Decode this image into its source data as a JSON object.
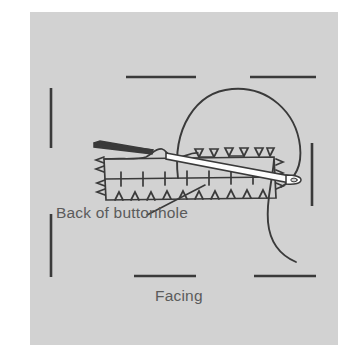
{
  "figure": {
    "type": "sewing-illustration",
    "panel": {
      "background_color": "#d2d2d2",
      "page_background_color": "#ffffff"
    },
    "ink_color": "#3a3a3a",
    "label_color": "#5b5b5b",
    "labels": [
      {
        "id": "back-of-buttonhole",
        "text": "Back of buttonhole"
      },
      {
        "id": "facing",
        "text": "Facing"
      }
    ],
    "parts": [
      {
        "name": "buttonhole-rectangle",
        "description": "stitched buttonhole outline"
      },
      {
        "name": "needle",
        "description": "hand sewing needle passing through fabric"
      },
      {
        "name": "thread-loop",
        "description": "thread looping above the needle"
      },
      {
        "name": "thread-tail",
        "description": "thread curving down at right"
      },
      {
        "name": "fabric-edge",
        "description": "folded facing edge at upper left"
      },
      {
        "name": "leader-line",
        "description": "pointer from label to buttonhole stitching"
      },
      {
        "name": "crop-marks",
        "description": "dashes marking the facing opening"
      }
    ]
  }
}
